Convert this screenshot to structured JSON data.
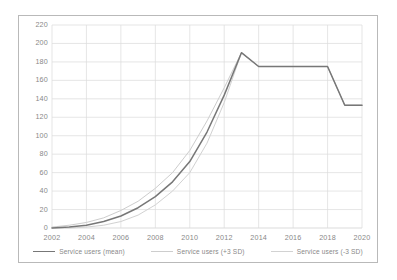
{
  "chart_data": {
    "type": "line",
    "title": "",
    "subtitle": "",
    "xlabel": "",
    "ylabel": "",
    "grid": true,
    "legend_position": "bottom",
    "xlim": [
      2002,
      2020
    ],
    "ylim": [
      0,
      220
    ],
    "y_ticks": [
      0,
      20,
      40,
      60,
      80,
      100,
      120,
      140,
      160,
      180,
      200,
      220
    ],
    "x_ticks": [
      2002,
      2004,
      2006,
      2008,
      2010,
      2012,
      2014,
      2016,
      2018,
      2020
    ],
    "x": [
      2002,
      2003,
      2004,
      2005,
      2006,
      2007,
      2008,
      2009,
      2010,
      2011,
      2012,
      2013,
      2014,
      2015,
      2016,
      2017,
      2018,
      2019,
      2020
    ],
    "series": [
      {
        "name": "Service users (mean)",
        "color": "#5a5a5a",
        "values": [
          0,
          1,
          3,
          7,
          13,
          22,
          34,
          50,
          72,
          104,
          144,
          190,
          175,
          175,
          175,
          175,
          175,
          133,
          133
        ]
      },
      {
        "name": "Service users (+3 SD)",
        "color": "#c2c2c2",
        "values": [
          1,
          3,
          6,
          11,
          19,
          29,
          43,
          60,
          84,
          116,
          152,
          190,
          175,
          175,
          175,
          175,
          175,
          133,
          133
        ]
      },
      {
        "name": "Service users (-3 SD)",
        "color": "#c8c8c8",
        "values": [
          0,
          0,
          1,
          3,
          7,
          14,
          25,
          40,
          60,
          92,
          136,
          190,
          175,
          175,
          175,
          175,
          175,
          133,
          133
        ]
      }
    ],
    "annotations": []
  },
  "legend": {
    "items": [
      {
        "label": "Service users (mean)",
        "color": "#5a5a5a"
      },
      {
        "label": "Service users (+3 SD)",
        "color": "#c2c2c2"
      },
      {
        "label": "Service users (-3 SD)",
        "color": "#c8c8c8"
      }
    ]
  },
  "axes": {
    "y_labels": [
      "220",
      "200",
      "180",
      "160",
      "140",
      "120",
      "100",
      "80",
      "60",
      "40",
      "20",
      "0"
    ],
    "x_labels": [
      "2002",
      "2004",
      "2006",
      "2008",
      "2010",
      "2012",
      "2014",
      "2016",
      "2018",
      "2020"
    ]
  }
}
